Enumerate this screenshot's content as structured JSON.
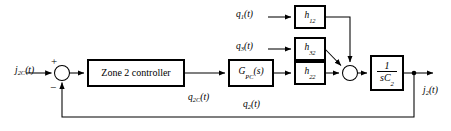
{
  "diagram": {
    "type": "control-system-block-diagram",
    "colors": {
      "line": "#000000",
      "block_fill": "#ffffff",
      "block_stroke": "#000000",
      "background": "#ffffff"
    },
    "signals": {
      "reference_input": "j",
      "reference_input_sub": "2C",
      "reference_input_arg": "(t)",
      "output": "j",
      "output_sub": "2",
      "output_arg": "(t)",
      "controller_output": "q",
      "controller_output_sub": "2C",
      "controller_output_arg": "(t)",
      "plant_flow": "q",
      "plant_flow_sub": "2",
      "plant_flow_arg": "(t)",
      "disturbance_1": "q",
      "disturbance_1_sub": "1",
      "disturbance_1_arg": "(t)",
      "disturbance_3": "q",
      "disturbance_3_sub": "3",
      "disturbance_3_arg": "(t)"
    },
    "summing_junction": {
      "plus_sign": "+",
      "minus_sign": "−"
    },
    "blocks": {
      "controller": {
        "label": "Zone 2 controller"
      },
      "gpc": {
        "base": "G",
        "sub": "PC",
        "arg": "(s)"
      },
      "h12": {
        "base": "h",
        "sub": "12"
      },
      "h32": {
        "base": "h",
        "sub": "32"
      },
      "h22": {
        "base": "h",
        "sub": "22"
      },
      "integrator": {
        "numerator": "1",
        "denominator_s": "s",
        "denominator_c": "C",
        "denominator_sub": "2"
      }
    }
  }
}
